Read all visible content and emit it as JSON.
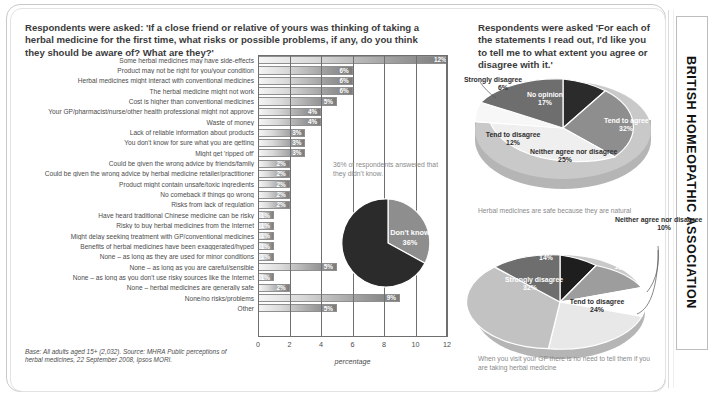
{
  "brand": {
    "name": "BRITISH HOMEOPATHIC ASSOCIATION"
  },
  "headings": {
    "left": "Respondents were asked: 'If a close friend or relative of yours was thinking of taking a herbal medicine for the first time, what risks or possible problems, if any, do you think they should be aware of? What are they?'",
    "right": "Respondents were asked 'For each of the statements I read out, I'd like you to tell me to what extent you agree or disagree with it.'"
  },
  "footnote": {
    "text": "Base: All adults aged 15+ (2,032). Source: MHRA Public perceptions of herbal medicines, 22 September 2008, Ipsos MORI."
  },
  "donut": {
    "caption": "36% of respondents answered that they didn't know.",
    "label": "Don't know",
    "value": "36%"
  },
  "chart_data": [
    {
      "type": "bar",
      "orientation": "horizontal",
      "title": "",
      "xlabel": "percentage",
      "ylabel": "",
      "xlim": [
        0,
        12
      ],
      "xticks": [
        "0",
        "2",
        "4",
        "6",
        "8",
        "10",
        "12"
      ],
      "grid": true,
      "categories": [
        "Some herbal medicines may have side-effects",
        "Product may not be right for you/your condition",
        "Herbal medicines might interact with conventional medicines",
        "The herbal medicine might not work",
        "Cost is higher than conventional medicines",
        "Your GP/pharmacist/nurse/other health professional might not approve",
        "Waste of money",
        "Lack of reliable information about products",
        "You don't know for sure what you are getting",
        "Might get 'ripped off'",
        "Could be given the wrong advice by friends/family",
        "Could be given the wrong advice by herbal medicine retailer/practitioner",
        "Product might contain unsafe/toxic ingredients",
        "No comeback if things go wrong",
        "Risks from lack of regulation",
        "Have heard traditional Chinese medicine can be risky",
        "Risky to buy herbal medicines from the Internet",
        "Might delay seeking treatment with GP/conventional medicines",
        "Benefits of herbal medicines have been exaggerated/hyped",
        "None – as long as they are used for minor conditions",
        "None – as long as you are careful/sensible",
        "None – as long as you don't use risky sources like the Internet",
        "None – herbal medicines are generally safe",
        "None/no risks/problems",
        "Other"
      ],
      "values": [
        12,
        6,
        6,
        6,
        5,
        4,
        4,
        3,
        3,
        3,
        2,
        2,
        2,
        2,
        2,
        1,
        1,
        1,
        1,
        1,
        5,
        1,
        2,
        9,
        5
      ],
      "value_labels": [
        "12%",
        "6%",
        "6%",
        "6%",
        "5%",
        "4%",
        "4%",
        "3%",
        "3%",
        "3%",
        "2%",
        "2%",
        "2%",
        "2%",
        "2%",
        "1%",
        "1%",
        "1%",
        "1%",
        "1%",
        "5%",
        "1%",
        "2%",
        "9%",
        "5%"
      ]
    },
    {
      "type": "pie",
      "title": "",
      "caption": "Herbal medicines are safe because they are natural",
      "labels": [
        "Strongly agree",
        "Tend to agree",
        "Neither agree nor disagree",
        "Tend to disagree",
        "Strongly disagree",
        "No opinion"
      ],
      "values": [
        8,
        32,
        25,
        12,
        6,
        17
      ],
      "value_labels": [
        "8%",
        "32%",
        "25%",
        "12%",
        "6%",
        "17%"
      ]
    },
    {
      "type": "pie",
      "title": "",
      "caption": "When you visit your GP there is no need to tell them if you are taking herbal medicine",
      "labels": [
        "Strongly agree",
        "Tend to agree",
        "Neither agree nor disagree",
        "Tend to disagree",
        "Strongly disagree",
        "No opinion"
      ],
      "values": [
        7,
        13,
        10,
        24,
        32,
        14
      ],
      "value_labels": [
        "7%",
        "13%",
        "10%",
        "24%",
        "32%",
        "14%"
      ]
    }
  ],
  "pie1_text": {
    "strongly_agree": "Strongly agree",
    "strongly_agree_v": "8%",
    "tend_to_agree": "Tend to agree",
    "tend_to_agree_v": "32%",
    "neither": "Neither agree nor disagree",
    "neither_v": "25%",
    "tend_to_disagree": "Tend to disagree",
    "tend_to_disagree_v": "12%",
    "strongly_disagree": "Strongly disagree",
    "strongly_disagree_v": "6%",
    "no_opinion": "No opinion",
    "no_opinion_v": "17%"
  },
  "pie2_text": {
    "strongly_agree": "Strongly agree",
    "strongly_agree_v": "7%",
    "tend_to_agree": "Tend to agree",
    "tend_to_agree_v": "13%",
    "neither": "Neither agree nor disagree",
    "neither_v": "10%",
    "tend_to_disagree": "Tend to disagree",
    "tend_to_disagree_v": "24%",
    "strongly_disagree": "Strongly disagree",
    "strongly_disagree_v": "32%",
    "no_opinion": "No opinion",
    "no_opinion_v": "14%"
  },
  "colors": {
    "bar_dark": "#7c7c7c",
    "pie_dark": "#2b2b2b",
    "pie_mid": "#8e8e8e",
    "pie_light": "#d8d8d8",
    "pie_pale": "#f0f0f0",
    "text": "#4a4a4a"
  }
}
